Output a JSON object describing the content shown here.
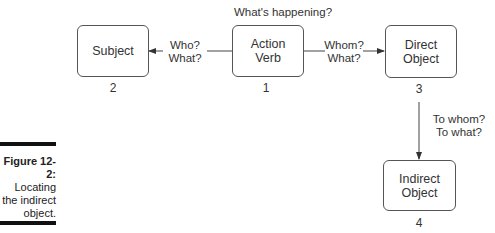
{
  "diagram": {
    "nodes": [
      {
        "id": "subject",
        "label_line1": "Subject",
        "label_line2": "",
        "number": "2"
      },
      {
        "id": "action_verb",
        "label_line1": "Action",
        "label_line2": "Verb",
        "number": "1"
      },
      {
        "id": "direct_object",
        "label_line1": "Direct",
        "label_line2": "Object",
        "number": "3"
      },
      {
        "id": "indirect_object",
        "label_line1": "Indirect",
        "label_line2": "Object",
        "number": "4"
      }
    ],
    "top_question": "What's happening?",
    "edges": [
      {
        "from": "action_verb",
        "to": "subject",
        "line1": "Who?",
        "line2": "What?"
      },
      {
        "from": "action_verb",
        "to": "direct_object",
        "line1": "Whom?",
        "line2": "What?"
      },
      {
        "from": "direct_object",
        "to": "indirect_object",
        "line1": "To whom?",
        "line2": "To what?"
      }
    ]
  },
  "caption": {
    "figure": "Figure 12-2:",
    "line1": "Locating",
    "line2": "the indirect",
    "line3": "object."
  }
}
